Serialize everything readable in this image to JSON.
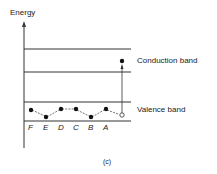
{
  "diagram": {
    "axis_label": "Energy",
    "bands": {
      "conduction": "Conduction band",
      "valence": "Valence band"
    },
    "sites": [
      "F",
      "E",
      "D",
      "C",
      "B",
      "A"
    ],
    "caption": "(c)"
  },
  "colors": {
    "line": "#222222",
    "background": "#ffffff"
  }
}
